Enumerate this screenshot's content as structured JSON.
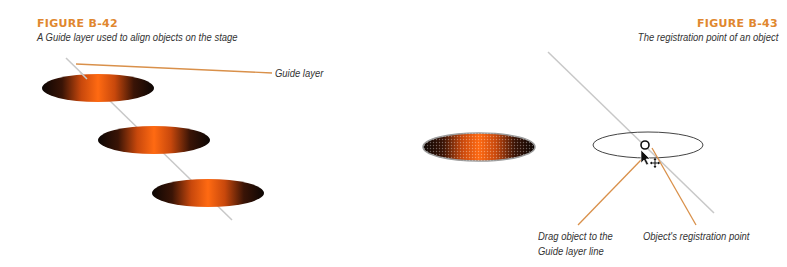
{
  "figures": [
    {
      "id": "B-42",
      "title": "FIGURE B-42",
      "caption": "A Guide layer used to align objects on the stage",
      "callouts": [
        {
          "text": "Guide layer"
        }
      ],
      "objects": [
        {
          "type": "gradient-ellipse",
          "cx": 98,
          "cy": 88,
          "rx": 56,
          "ry": 14
        },
        {
          "type": "gradient-ellipse",
          "cx": 154,
          "cy": 140,
          "rx": 56,
          "ry": 14
        },
        {
          "type": "gradient-ellipse",
          "cx": 208,
          "cy": 193,
          "rx": 56,
          "ry": 14
        }
      ]
    },
    {
      "id": "B-43",
      "title": "FIGURE B-43",
      "caption": "The registration point of an object",
      "callouts": [
        {
          "text_line1": "Drag object to the",
          "text_line2": "Guide layer line"
        },
        {
          "text": "Object's registration point"
        }
      ],
      "objects": [
        {
          "type": "dithered-gradient-ellipse",
          "cx": 479,
          "cy": 147,
          "rx": 56,
          "ry": 14
        },
        {
          "type": "outline-ellipse",
          "cx": 648,
          "cy": 145,
          "rx": 55,
          "ry": 13
        }
      ]
    }
  ],
  "colors": {
    "title": "#e0872f",
    "callout_line": "#d9904a",
    "guide_line": "#c8c8c8",
    "gradient_center": "#ff6a10",
    "gradient_edge": "#1a0a04"
  },
  "icons": {
    "cursor": "arrow-cursor-with-move-icon",
    "registration_point": "circle-registration-icon"
  }
}
